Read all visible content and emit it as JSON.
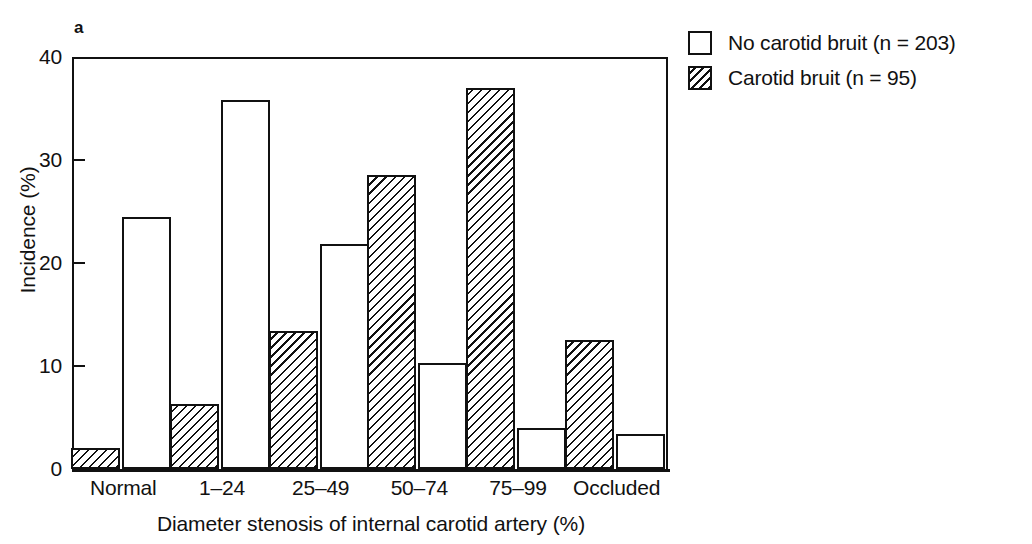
{
  "figure": {
    "panel_letter": "a"
  },
  "chart_data": {
    "type": "bar",
    "title": "",
    "xlabel": "Diameter stenosis of internal carotid artery (%)",
    "ylabel": "Incidence (%)",
    "categories": [
      "Normal",
      "1–24",
      "25–49",
      "50–74",
      "75–99",
      "Occluded"
    ],
    "series": [
      {
        "name": "Carotid bruit (n = 95)",
        "style": "hatched",
        "values": [
          2.0,
          6.3,
          13.4,
          28.5,
          37.0,
          12.5
        ]
      },
      {
        "name": "No carotid bruit (n = 203)",
        "style": "open",
        "values": [
          24.5,
          35.8,
          21.8,
          10.3,
          4.0,
          3.4
        ]
      }
    ],
    "ylim": [
      0,
      40
    ],
    "yticks": [
      0,
      10,
      20,
      30,
      40
    ],
    "ytick_labels": [
      "0",
      "10",
      "20",
      "30",
      "40"
    ],
    "grid": false,
    "legend_position": "right-top"
  },
  "legend": {
    "items": [
      {
        "label": "No carotid bruit (n = 203)",
        "style": "open"
      },
      {
        "label": "Carotid bruit (n = 95)",
        "style": "hatched"
      }
    ]
  }
}
